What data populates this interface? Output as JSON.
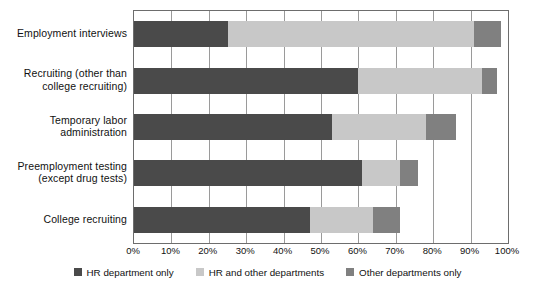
{
  "chart_data": {
    "type": "bar",
    "orientation": "horizontal",
    "stacked": true,
    "title": "",
    "xlabel": "",
    "ylabel": "",
    "xlim": [
      0,
      100
    ],
    "xunit": "%",
    "grid": true,
    "legend_position": "bottom",
    "xticks": [
      "0%",
      "10%",
      "20%",
      "30%",
      "40%",
      "50%",
      "60%",
      "70%",
      "80%",
      "90%",
      "100%"
    ],
    "xtick_values": [
      0,
      10,
      20,
      30,
      40,
      50,
      60,
      70,
      80,
      90,
      100
    ],
    "categories": [
      "Employment interviews",
      "Recruiting (other than\ncollege recruiting)",
      "Temporary labor\nadministration",
      "Preemployment testing\n(except drug tests)",
      "College recruiting"
    ],
    "series": [
      {
        "name": "HR department only",
        "color": "#4a4a4a",
        "values": [
          25,
          60,
          53,
          61,
          47
        ]
      },
      {
        "name": "HR and other departments",
        "color": "#c8c8c8",
        "values": [
          66,
          33,
          25,
          10,
          17
        ]
      },
      {
        "name": "Other departments only",
        "color": "#808080",
        "values": [
          7,
          4,
          8,
          5,
          7
        ]
      }
    ]
  },
  "legend": {
    "items": [
      {
        "label": "HR department only",
        "color": "#4a4a4a"
      },
      {
        "label": "HR and other departments",
        "color": "#c8c8c8"
      },
      {
        "label": "Other departments only",
        "color": "#808080"
      }
    ]
  },
  "axis": {
    "frame_color": "#6d6d6d",
    "gridline_color": "#9a9a9a"
  }
}
